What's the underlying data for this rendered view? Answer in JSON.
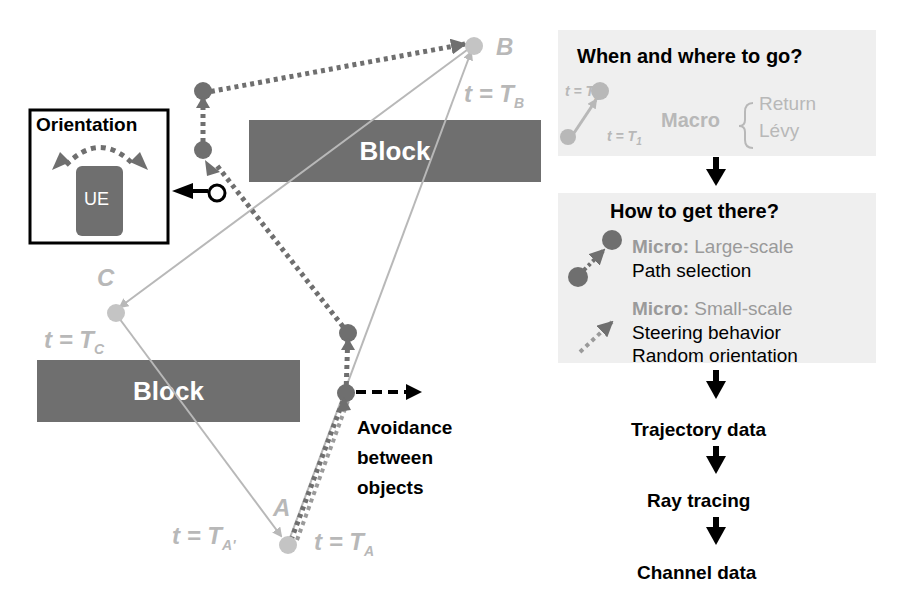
{
  "diagram": {
    "blocks": [
      {
        "label": "Block",
        "x": 249,
        "y": 120,
        "w": 292,
        "h": 62
      },
      {
        "label": "Block",
        "x": 37,
        "y": 360,
        "w": 263,
        "h": 62
      }
    ],
    "orientation_box": {
      "title": "Orientation",
      "device_label": "UE"
    },
    "points": {
      "A": {
        "label": "A",
        "time": "t = T",
        "sub": "A",
        "time2": "t = T",
        "sub2": "A'"
      },
      "B": {
        "label": "B",
        "time": "t = T",
        "sub": "B"
      },
      "C": {
        "label": "C",
        "time": "t = T",
        "sub": "C"
      }
    },
    "avoidance_label": [
      "Avoidance",
      "between",
      "objects"
    ]
  },
  "flow": {
    "macro_panel": {
      "title": "When and where to go?",
      "t2": "t = T",
      "t2_sub": "2",
      "t1": "t = T",
      "t1_sub": "1",
      "macro_label": "Macro",
      "options": [
        "Return",
        "Lévy"
      ]
    },
    "micro_panel": {
      "title": "How to get there?",
      "large": {
        "prefix": "Micro:",
        "scale": "Large-scale",
        "desc": "Path selection"
      },
      "small": {
        "prefix": "Micro:",
        "scale": "Small-scale",
        "desc": [
          "Steering behavior",
          "Random orientation"
        ]
      }
    },
    "steps": [
      "Trajectory data",
      "Ray tracing",
      "Channel data"
    ]
  },
  "colors": {
    "dark_gray": "#6f6f6f",
    "light_gray": "#b8b8b8",
    "panel_bg": "#efefef",
    "black": "#000000"
  }
}
